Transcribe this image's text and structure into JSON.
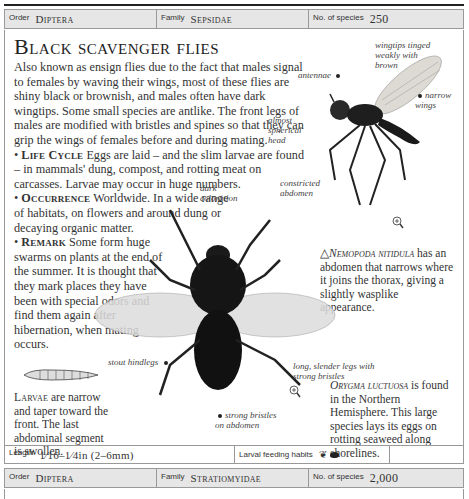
{
  "header": {
    "order_label": "Order",
    "order_value": "Diptera",
    "family_label": "Family",
    "family_value": "Sepsidae",
    "species_label": "No. of species",
    "species_value": "250"
  },
  "title": "Black scavenger flies",
  "body": {
    "intro": "Also known as ensign flies due to the fact that males signal to females by waving their wings, most of these flies are shiny black or brownish, and males often have dark wingtips. Some small species are antlike. The front legs of males are modified with bristles and spines so that they can grip the wings of females before and during mating.",
    "life_cycle_label": "Life Cycle",
    "life_cycle_text": "Eggs are laid – and the slim larvae are found – in mammals' dung, compost, and rotting meat on carcasses. Larvae may occur in huge numbers.",
    "occurrence_label": "Occurrence",
    "occurrence_text": "Worldwide. In a wide range of habitats, on flowers and around dung or decaying organic matter.",
    "remark_label": "Remark",
    "remark_text": "Some form huge swarms on plants at the end of the summer. It is thought that they mark places they have been with special odors and find them again after hibernation, when mating occurs."
  },
  "annotations": {
    "wingtips": "wingtips tinged weakly with brown",
    "antennae": "antennae",
    "narrow_wings": "narrow wings",
    "spherical_head": "almost spherical head",
    "constricted_abdomen": "constricted abdomen",
    "dark_coloration": "dark coloration",
    "stout_hindlegs": "stout hindlegs",
    "slender_legs": "long, slender legs with strong bristles",
    "strong_bristles": "strong bristles on abdomen"
  },
  "captions": {
    "nemopoda_name": "Nemopoda nitidula",
    "nemopoda_text": "has an abdomen that narrows where it joins the thorax, giving a slightly wasplike appearance.",
    "orygma_name": "Orygma luctuosa",
    "orygma_text": "is found in the Northern Hemisphere. This large species lays its eggs on rotting seaweed along shorelines.",
    "larvae_label": "Larvae",
    "larvae_text": "are narrow and taper toward the front. The last abdominal segment is swollen."
  },
  "footer": {
    "length_label": "Length",
    "length_value": "1⁄16–1⁄4in (2–6mm)",
    "feeding_label": "Larval feeding habits",
    "feeding_icons": [
      "plant-matter-icon",
      "dung-icon"
    ]
  },
  "next_entry": {
    "order_label": "Order",
    "order_value": "Diptera",
    "family_label": "Family",
    "family_value": "Stratiomyidae",
    "species_label": "No. of species",
    "species_value": "2,000"
  }
}
